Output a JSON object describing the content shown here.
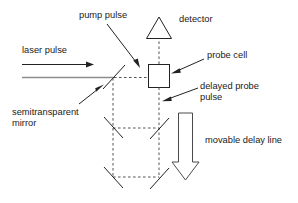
{
  "diagram": {
    "labels": {
      "pump_pulse": "pump pulse",
      "detector": "detector",
      "laser_pulse": "laser pulse",
      "probe_cell": "probe cell",
      "delayed_probe_pulse_line1": "delayed probe",
      "delayed_probe_pulse_line2": "pulse",
      "semitransparent_mirror_line1": "semitransparent",
      "semitransparent_mirror_line2": "mirror",
      "movable_delay_line": "movable delay line"
    },
    "colors": {
      "stroke": "#222222",
      "dashed_stroke": "#555555",
      "beam": "#8d8d8d",
      "background": "#ffffff",
      "text": "#1a1a1a"
    },
    "components": {
      "detector_shape": "triangle",
      "probe_cell_shape": "rectangle",
      "delay_arrow_direction": "down",
      "mirror_count": 5
    }
  }
}
